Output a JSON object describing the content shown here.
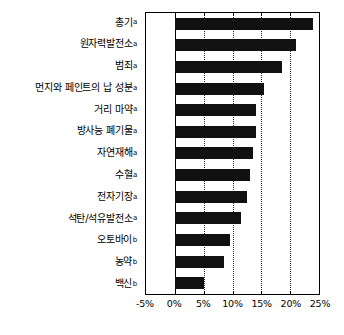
{
  "chart_data": {
    "type": "bar",
    "orientation": "horizontal",
    "title": "",
    "subtitle": "",
    "xlabel": "",
    "ylabel": "",
    "xlim": [
      -5,
      25
    ],
    "xunit": "%",
    "xticks": [
      -5,
      0,
      5,
      10,
      15,
      20,
      25
    ],
    "xtick_labels": [
      "-5%",
      "0%",
      "5%",
      "10%",
      "15%",
      "20%",
      "25%"
    ],
    "grid": "vertical dotted gridlines at 5%, 10%, 15%, 20%",
    "legend": "none",
    "bar_color": "#111111",
    "categories": [
      "총기",
      "원자력발전소",
      "범죄",
      "먼지와 페인트의 납 성분",
      "거리 마약",
      "방사능 폐기물",
      "자연재해",
      "수혈",
      "전자기장",
      "석탄/석유발전소",
      "오토바이",
      "농약",
      "백신"
    ],
    "category_markers": [
      "a",
      "a",
      "a",
      "a",
      "a",
      "a",
      "a",
      "a",
      "a",
      "a",
      "b",
      "b",
      "b"
    ],
    "values": [
      24.0,
      21.0,
      18.5,
      15.5,
      14.0,
      14.0,
      13.5,
      13.0,
      12.5,
      11.5,
      9.5,
      8.5,
      5.0
    ]
  }
}
